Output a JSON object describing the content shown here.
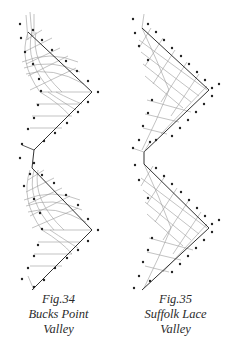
{
  "figures": [
    {
      "number": "Fig.34",
      "name_line1": "Bucks Point",
      "name_line2": "Valley",
      "style": "curved-ground"
    },
    {
      "number": "Fig.35",
      "name_line1": "Suffolk Lace",
      "name_line2": "Valley",
      "style": "grid-ground"
    }
  ],
  "colors": {
    "outline": "#333333",
    "thread": "#9a9a9a",
    "pin": "#222222",
    "caption": "#2a2a2a"
  }
}
